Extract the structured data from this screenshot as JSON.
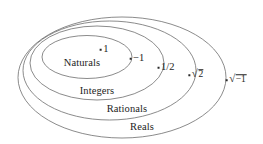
{
  "diagram": {
    "stroke_color": "#6d6d6d",
    "text_color": "#1d1d1d",
    "background": "#ffffff",
    "sets": [
      {
        "name": "naturals",
        "label": "Naturals",
        "label_x": 82,
        "label_y": 62,
        "cx": 87,
        "cy": 57,
        "rx": 45,
        "ry": 21.5
      },
      {
        "name": "integers",
        "label": "Integers",
        "label_x": 97,
        "label_y": 90,
        "cx": 97,
        "cy": 63,
        "rx": 67,
        "ry": 37
      },
      {
        "name": "rationals",
        "label": "Rationals",
        "label_x": 127,
        "label_y": 108,
        "cx": 109.5,
        "cy": 70.5,
        "rx": 86.5,
        "ry": 49.5
      },
      {
        "name": "reals",
        "label": "Reals",
        "label_x": 142,
        "label_y": 126,
        "cx": 122,
        "cy": 77.5,
        "rx": 104,
        "ry": 60.5
      }
    ],
    "points": [
      {
        "name": "one",
        "label": "1",
        "type": "plain",
        "x": 104,
        "y": 49
      },
      {
        "name": "negative-one",
        "label": "−1",
        "type": "plain",
        "x": 137,
        "y": 58
      },
      {
        "name": "one-half",
        "label": "1/2",
        "type": "plain",
        "x": 166,
        "y": 67
      },
      {
        "name": "sqrt-two",
        "label": "√2",
        "type": "radical",
        "radicand": "2",
        "x": 196,
        "y": 74
      },
      {
        "name": "sqrt-negative-one",
        "label": "√−1",
        "type": "radical",
        "radicand": "−1",
        "x": 236,
        "y": 79
      }
    ]
  }
}
